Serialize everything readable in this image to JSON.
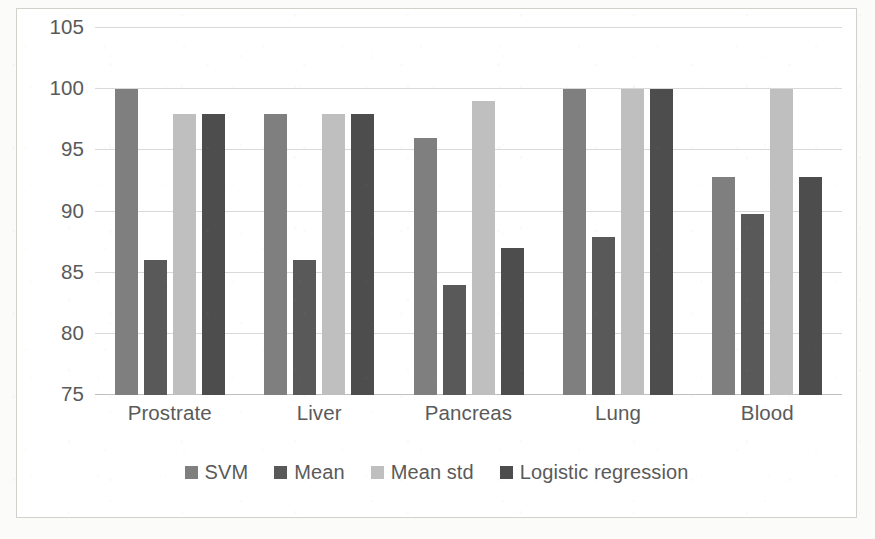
{
  "chart_data": {
    "type": "bar",
    "title": "",
    "xlabel": "",
    "ylabel": "",
    "ylim": [
      75,
      105
    ],
    "yticks": [
      105,
      100,
      95,
      90,
      85,
      80,
      75
    ],
    "grid": true,
    "legend_position": "bottom",
    "categories": [
      "Prostrate",
      "Liver",
      "Pancreas",
      "Lung",
      "Blood"
    ],
    "series": [
      {
        "name": "SVM",
        "color": "#7f7f7f",
        "values": [
          100,
          98,
          96,
          100,
          92.8
        ]
      },
      {
        "name": "Mean",
        "color": "#595959",
        "values": [
          86,
          86,
          84,
          87.9,
          89.8
        ]
      },
      {
        "name": "Mean std",
        "color": "#bfbfbf",
        "values": [
          98,
          98,
          99,
          100,
          100
        ]
      },
      {
        "name": "Logistic regression",
        "color": "#4d4d4d",
        "values": [
          98,
          98,
          87,
          100,
          92.8
        ]
      }
    ]
  }
}
